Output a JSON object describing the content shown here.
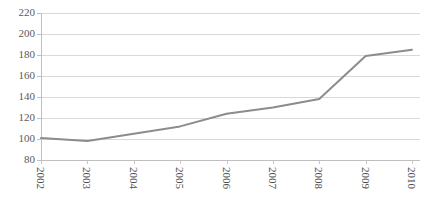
{
  "chart_data": {
    "type": "line",
    "title": "",
    "subtitle": "",
    "xlabel": "",
    "ylabel": "",
    "categories": [
      "2002",
      "2003",
      "2004",
      "2005",
      "2006",
      "2007",
      "2008",
      "2009",
      "2010"
    ],
    "values": [
      101,
      98,
      105,
      112,
      124,
      130,
      138,
      179,
      185
    ],
    "series": [
      {
        "name": "",
        "values": [
          101,
          98,
          105,
          112,
          124,
          130,
          138,
          179,
          185
        ]
      }
    ],
    "ylim": [
      80,
      220
    ],
    "yticks": [
      80,
      100,
      120,
      140,
      160,
      180,
      200,
      220
    ],
    "ytick_labels": [
      "80",
      "100",
      "120",
      "140",
      "160",
      "180",
      "200",
      "220"
    ],
    "xtick_labels": [
      "2002",
      "2003",
      "2004",
      "2005",
      "2006",
      "2007",
      "2008",
      "2009",
      "2010"
    ],
    "xtick_rotation": 90,
    "grid": "horizontal",
    "legend": "none",
    "markers": "none",
    "colors": {
      "line": "#8c8c8c",
      "grid": "#d9d9d9",
      "axis": "#bfbfbf",
      "ytick_label": "#5a5a5a",
      "xtick_label": "#4d4d4d",
      "background": "#ffffff"
    }
  }
}
